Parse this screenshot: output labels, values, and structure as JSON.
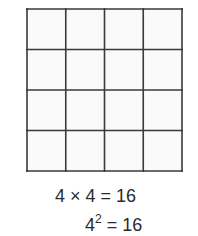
{
  "figure": {
    "grid": {
      "rows": 4,
      "columns": 4,
      "total_squares": 16,
      "line_color": "#3a3a3a",
      "cell_fill": "#fafafa"
    },
    "equations": {
      "line1": {
        "text": "4 × 4 = 16"
      },
      "line2": {
        "base": "4",
        "exponent": "2",
        "rest": " = 16"
      }
    }
  }
}
